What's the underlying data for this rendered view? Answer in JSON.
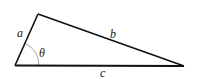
{
  "diagram": {
    "type": "triangle",
    "vertices": {
      "bottom_left": [
        15,
        65
      ],
      "top": [
        38,
        14
      ],
      "bottom_right": [
        184,
        66
      ]
    },
    "sides": {
      "a": {
        "label": "a",
        "from": "bottom_left",
        "to": "top",
        "label_pos": [
          20,
          36
        ]
      },
      "b": {
        "label": "b",
        "from": "top",
        "to": "bottom_right",
        "label_pos": [
          110,
          37
        ]
      },
      "c": {
        "label": "c",
        "from": "bottom_left",
        "to": "bottom_right",
        "label_pos": [
          101,
          77
        ]
      }
    },
    "angle": {
      "label": "θ",
      "vertex": "bottom_left",
      "label_pos": [
        40,
        56
      ],
      "arc_radius": 24
    },
    "colors": {
      "stroke": "#111111",
      "arc": "#888888",
      "background": "#ffffff"
    }
  }
}
